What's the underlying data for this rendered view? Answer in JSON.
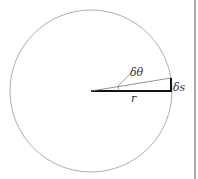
{
  "diagram": {
    "labels": {
      "angle": "δθ",
      "arc": "δs",
      "radius": "r"
    },
    "colors": {
      "circle": "#999999",
      "lines": "#111111",
      "thin_line": "#777777"
    }
  }
}
